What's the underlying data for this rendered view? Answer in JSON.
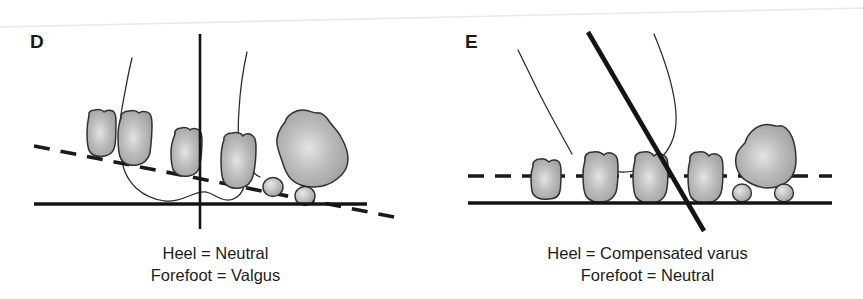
{
  "figure": {
    "kind": "anatomical-line-diagram",
    "width": 863,
    "height": 299,
    "background_color": "#ffffff"
  },
  "colors": {
    "ink": "#1a1a1a",
    "bone_fill": "#aeaeae",
    "bone_fill_light": "#dcdcdc",
    "bone_outline": "#3a3a3a",
    "text": "#1c1c1c",
    "scan_line": "#e6e6e6"
  },
  "panels": [
    {
      "id": "D",
      "letter": "D",
      "caption_line1": "Heel = Neutral",
      "caption_line2": "Forefoot = Valgus",
      "heel_axis": {
        "name": "heel-bisector-axis",
        "style": "solid-thin-vertical",
        "orientation": "vertical",
        "description": "vertical reference line through the heel indicating neutral heel position"
      },
      "forefoot_line": {
        "name": "forefoot-plane-line",
        "style": "dashed",
        "orientation": "tilted",
        "description": "dashed plane through the metatarsal heads, sloping downward toward the first metatarsal, indicating forefoot valgus"
      },
      "ground_line": {
        "name": "ground-line",
        "style": "solid-thick-horizontal"
      },
      "metatarsal_heads": 5,
      "sesamoids": 2,
      "bones_touch_ground": false
    },
    {
      "id": "E",
      "letter": "E",
      "caption_line1": "Heel = Compensated varus",
      "caption_line2": "Forefoot = Neutral",
      "heel_axis": {
        "name": "heel-bisector-axis",
        "style": "solid-thick-diagonal",
        "orientation": "tilted",
        "description": "thick tilted reference line through the heel indicating compensated varus"
      },
      "forefoot_line": {
        "name": "forefoot-plane-line",
        "style": "dashed",
        "orientation": "horizontal",
        "description": "horizontal dashed plane through the metatarsal heads indicating a neutral forefoot"
      },
      "ground_line": {
        "name": "ground-line",
        "style": "solid-thick-horizontal"
      },
      "metatarsal_heads": 5,
      "sesamoids": 2,
      "bones_touch_ground": true
    }
  ]
}
